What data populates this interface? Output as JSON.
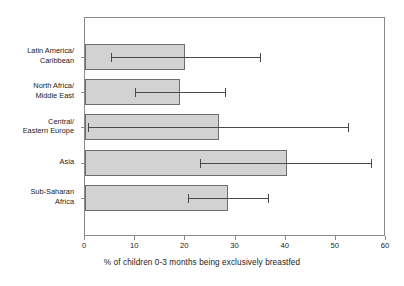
{
  "chart_data": {
    "type": "bar",
    "orientation": "horizontal",
    "title": "",
    "xlabel": "% of children 0-3 months being exclusively breastfed",
    "ylabel": "",
    "xlim": [
      0,
      60
    ],
    "xticks": [
      0,
      10,
      20,
      30,
      40,
      50,
      60
    ],
    "xtick_labels": [
      "0",
      "10",
      "20",
      "30",
      "40",
      "50",
      "60"
    ],
    "grid": false,
    "legend": null,
    "bar_color": "#d2d2d2",
    "bar_edge_color": "#6d6d6d",
    "error_bar_color": "#4a4a4a",
    "axis_color": "#8a8a8a",
    "categories": [
      "Latin America/\nCaribbean",
      "North Africa/\nMiddle East",
      "Central/\nEastern Europe",
      "Asia",
      "Sub-Saharan\nAfrica"
    ],
    "values": [
      20.0,
      19.0,
      26.7,
      40.2,
      28.5
    ],
    "error_low": [
      5.2,
      10.0,
      0.6,
      23.0,
      20.5
    ],
    "error_high": [
      34.9,
      27.9,
      52.4,
      57.0,
      36.5
    ],
    "points": [
      {
        "category": "Latin America/\nCaribbean",
        "value": 20.0,
        "low": 5.2,
        "high": 34.9
      },
      {
        "category": "North Africa/\nMiddle East",
        "value": 19.0,
        "low": 10.0,
        "high": 27.9
      },
      {
        "category": "Central/\nEastern Europe",
        "value": 26.7,
        "low": 0.6,
        "high": 52.4
      },
      {
        "category": "Asia",
        "value": 40.2,
        "low": 23.0,
        "high": 57.0
      },
      {
        "category": "Sub-Saharan\nAfrica",
        "value": 28.5,
        "low": 20.5,
        "high": 36.5
      }
    ]
  },
  "title_remnant": ""
}
